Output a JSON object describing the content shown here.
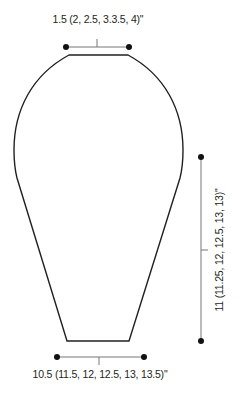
{
  "diagram": {
    "type": "knitting-schematic",
    "shape": "vase-shaped panel",
    "stroke_color": "#231f20",
    "measurement_color": "#777777",
    "top_measurement": {
      "label": "1.5 (2, 2.5, 3.3.5, 4)\""
    },
    "bottom_measurement": {
      "label": "10.5 (11.5, 12, 12.5, 13, 13.5)\""
    },
    "side_measurement": {
      "label": "11 (11.25, 12, 12.5, 13, 13)\""
    }
  }
}
